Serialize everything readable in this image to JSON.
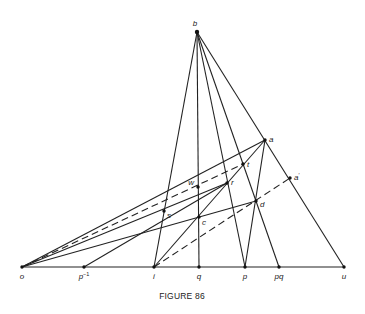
{
  "figure": {
    "caption": "FIGURE 86"
  },
  "points": {
    "b": {
      "label": "b",
      "x": 197,
      "y": 32
    },
    "o": {
      "label": "o",
      "x": 22,
      "y": 267
    },
    "pinv": {
      "label": "p",
      "sup": "−1",
      "x": 84,
      "y": 267
    },
    "i": {
      "label": "i",
      "x": 154,
      "y": 267
    },
    "q": {
      "label": "q",
      "x": 199,
      "y": 267
    },
    "p": {
      "label": "p",
      "x": 245,
      "y": 267
    },
    "pq": {
      "label": "pq",
      "x": 279,
      "y": 267
    },
    "u": {
      "label": "u",
      "x": 344,
      "y": 267
    },
    "a": {
      "label": "a",
      "x": 265,
      "y": 140
    },
    "t": {
      "label": "t",
      "x": 243,
      "y": 164
    },
    "r": {
      "label": "r",
      "x": 227,
      "y": 183
    },
    "w": {
      "label": "w",
      "x": 198,
      "y": 187
    },
    "s": {
      "label": "s",
      "x": 164,
      "y": 211
    },
    "c": {
      "label": "c",
      "x": 199,
      "y": 217
    },
    "d": {
      "label": "d",
      "x": 256,
      "y": 201
    },
    "aprime": {
      "label": "a",
      "sup": "′",
      "x": 290,
      "y": 178
    }
  },
  "segments_solid": [
    [
      "o",
      "u"
    ],
    [
      "b",
      "i"
    ],
    [
      "b",
      "q"
    ],
    [
      "b",
      "p"
    ],
    [
      "b",
      "pq"
    ],
    [
      "b",
      "u"
    ],
    [
      "o",
      "a"
    ],
    [
      "o",
      "r"
    ],
    [
      "o",
      "d"
    ],
    [
      "pinv",
      "r"
    ],
    [
      "i",
      "a"
    ],
    [
      "a",
      "p"
    ]
  ],
  "segments_dashed": [
    [
      "o",
      "t"
    ],
    [
      "i",
      "aprime"
    ]
  ]
}
